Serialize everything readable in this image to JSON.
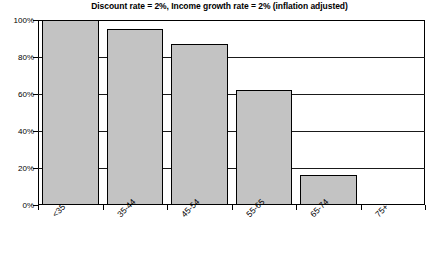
{
  "chart_data": {
    "type": "bar",
    "title": "Discount rate = 2%, Income growth rate = 2% (inflation adjusted)",
    "xlabel": "",
    "ylabel": "",
    "categories": [
      "<35",
      "35-44",
      "45-54",
      "55-65",
      "65-74",
      "75+"
    ],
    "values": [
      100,
      95,
      87,
      62,
      16,
      0
    ],
    "ytick_labels": [
      "0%",
      "20%",
      "40%",
      "60%",
      "80%",
      "100%"
    ],
    "ytick_values": [
      0,
      20,
      40,
      60,
      80,
      100
    ],
    "ylim": [
      0,
      100
    ],
    "grid": true,
    "legend": "none",
    "bar_color": "#c3c3c3",
    "bar_border_color": "#000000",
    "axis_color": "#000000",
    "background_color": "#ffffff",
    "xtick_label_rotation": -45
  }
}
